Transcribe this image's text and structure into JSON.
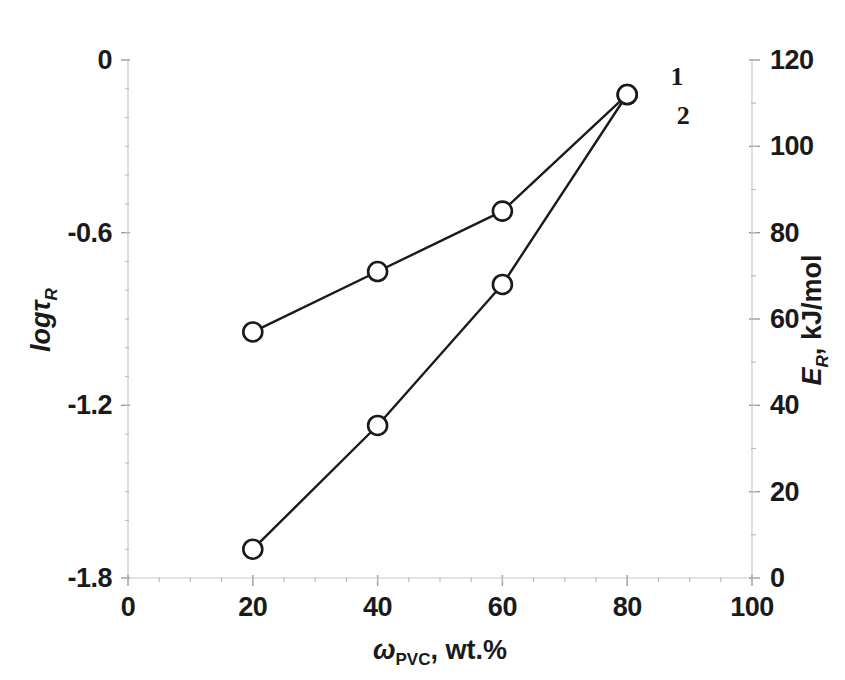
{
  "chart_data": {
    "type": "line",
    "title": "",
    "xlabel": "ωPVC, wt.%",
    "xlabel_parts": {
      "symbol": "ω",
      "subscript": "PVC",
      "rest": ", wt.%"
    },
    "ylabel_left": "logτR",
    "ylabel_left_parts": {
      "main": "logτ",
      "subscript": "R"
    },
    "ylabel_right": "ER, kJ/mol",
    "ylabel_right_parts": {
      "main": "E",
      "subscript": "R",
      "rest": ", kJ/mol"
    },
    "xlim": [
      0,
      100
    ],
    "xticks": [
      0,
      20,
      40,
      60,
      80,
      100
    ],
    "xticklabels": [
      "0",
      "20",
      "40",
      "60",
      "80",
      "100"
    ],
    "ylim_left": [
      -1.8,
      0
    ],
    "yticks_left": [
      0,
      -0.6,
      -1.2,
      -1.8
    ],
    "yticklabels_left": [
      "0",
      "-0.6",
      "-1.2",
      "-1.8"
    ],
    "ylim_right": [
      0,
      120
    ],
    "yticks_right": [
      0,
      20,
      40,
      60,
      80,
      100,
      120
    ],
    "yticklabels_right": [
      "0",
      "20",
      "40",
      "60",
      "80",
      "100",
      "120"
    ],
    "grid": false,
    "legend_position": "inline-right-end",
    "marker": "open-circle",
    "line_color": "#1a1a1a",
    "marker_fill": "#ffffff",
    "series": [
      {
        "name": "1",
        "label": "1",
        "axis": "right",
        "quantity": "ER, kJ/mol",
        "x": [
          20,
          40,
          60,
          80
        ],
        "values": [
          57,
          71,
          85,
          112
        ]
      },
      {
        "name": "2",
        "label": "2",
        "axis": "left",
        "quantity": "logτR",
        "x": [
          20,
          40,
          60,
          80
        ],
        "values": [
          -1.7,
          -1.27,
          -0.78,
          -0.12
        ]
      }
    ],
    "annotations": [
      {
        "text": "1",
        "x": 88,
        "axis": "right",
        "value": 116
      },
      {
        "text": "2",
        "x": 89,
        "axis": "right",
        "value": 107
      }
    ]
  }
}
